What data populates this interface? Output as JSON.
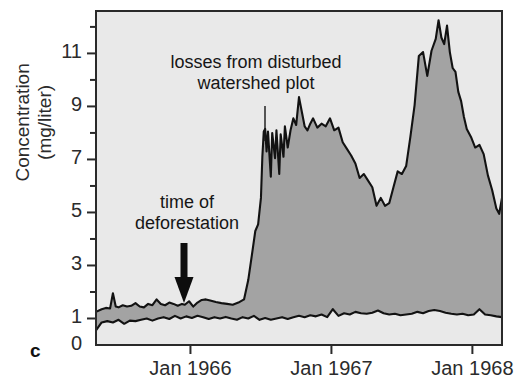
{
  "figure": {
    "panel_letter": "c",
    "ylabel": "Concentration\n(mg/liter)",
    "bg_color": "#e9e9e9",
    "fill_color": "#a3a3a3",
    "line_color": "#121212",
    "frame_color": "#2a2a2a"
  },
  "annotations": {
    "disturbed": {
      "text": "losses from disturbed\nwatershed plot",
      "leader_x": 265,
      "leader_y0": 106,
      "leader_y1": 141
    },
    "deforestation": {
      "text": "time of\ndeforestation",
      "arrow_x": 184,
      "arrow_top": 243,
      "arrow_tip": 303
    }
  },
  "chart_data": {
    "type": "area",
    "title": "",
    "xlabel": "",
    "ylabel": "Concentration (mg/liter)",
    "ylim": [
      0,
      12.6
    ],
    "ytick_values": [
      0,
      1,
      3,
      5,
      7,
      9,
      11
    ],
    "ytick_labels": [
      "0",
      "1",
      "3",
      "5",
      "7",
      "9",
      "11"
    ],
    "yminor_values": [
      2,
      4,
      6,
      8,
      10,
      12
    ],
    "grid": false,
    "legend": "none",
    "xtick_labels": [
      "Jan 1966",
      "Jan 1967",
      "Jan 1968"
    ],
    "xtick_positions": [
      1966.0,
      1967.0,
      1968.0
    ],
    "xlim": [
      1965.33,
      1968.21
    ],
    "event_markers": [
      {
        "label": "time of deforestation",
        "x": 1965.96
      },
      {
        "label": "losses from disturbed watershed plot",
        "x": 1966.53
      }
    ],
    "series": [
      {
        "name": "disturbed watershed plot",
        "x": [
          1965.33,
          1965.37,
          1965.4,
          1965.43,
          1965.45,
          1965.47,
          1965.49,
          1965.52,
          1965.55,
          1965.58,
          1965.61,
          1965.64,
          1965.67,
          1965.7,
          1965.73,
          1965.76,
          1965.79,
          1965.82,
          1965.85,
          1965.88,
          1965.91,
          1965.94,
          1965.96,
          1965.99,
          1966.02,
          1966.05,
          1966.08,
          1966.11,
          1966.14,
          1966.18,
          1966.22,
          1966.26,
          1966.3,
          1966.34,
          1966.38,
          1966.41,
          1966.44,
          1966.46,
          1966.48,
          1966.5,
          1966.51,
          1966.52,
          1966.53,
          1966.54,
          1966.55,
          1966.57,
          1966.58,
          1966.6,
          1966.61,
          1966.63,
          1966.64,
          1966.66,
          1966.67,
          1966.69,
          1966.71,
          1966.73,
          1966.75,
          1966.77,
          1966.79,
          1966.81,
          1966.83,
          1966.85,
          1966.87,
          1966.9,
          1966.93,
          1966.96,
          1966.99,
          1967.02,
          1967.05,
          1967.08,
          1967.11,
          1967.14,
          1967.17,
          1967.2,
          1967.23,
          1967.26,
          1967.29,
          1967.32,
          1967.35,
          1967.38,
          1967.41,
          1967.44,
          1967.47,
          1967.5,
          1967.53,
          1967.56,
          1967.59,
          1967.62,
          1967.65,
          1967.68,
          1967.71,
          1967.74,
          1967.76,
          1967.78,
          1967.8,
          1967.82,
          1967.84,
          1967.86,
          1967.88,
          1967.9,
          1967.92,
          1967.94,
          1967.96,
          1967.99,
          1968.02,
          1968.05,
          1968.08,
          1968.11,
          1968.14,
          1968.17,
          1968.19,
          1968.21
        ],
        "y": [
          1.25,
          1.35,
          1.4,
          1.38,
          1.95,
          1.45,
          1.42,
          1.5,
          1.45,
          1.48,
          1.58,
          1.45,
          1.42,
          1.55,
          1.5,
          1.72,
          1.55,
          1.5,
          1.6,
          1.55,
          1.48,
          1.55,
          1.52,
          1.65,
          1.45,
          1.6,
          1.7,
          1.72,
          1.68,
          1.62,
          1.58,
          1.55,
          1.52,
          1.6,
          1.72,
          2.45,
          3.55,
          4.3,
          4.55,
          5.55,
          7.1,
          8.05,
          8.15,
          7.3,
          8.05,
          6.35,
          8.0,
          7.05,
          8.1,
          6.45,
          7.95,
          7.1,
          8.25,
          7.45,
          8.1,
          8.55,
          8.3,
          9.35,
          8.8,
          8.25,
          8.1,
          8.35,
          8.55,
          8.2,
          8.35,
          8.25,
          8.55,
          8.1,
          8.2,
          7.65,
          7.4,
          7.15,
          6.85,
          6.3,
          6.45,
          6.2,
          5.95,
          5.25,
          5.55,
          5.25,
          5.35,
          5.95,
          6.55,
          6.45,
          6.75,
          7.85,
          9.05,
          10.9,
          11.05,
          10.15,
          11.1,
          11.55,
          12.25,
          11.6,
          11.35,
          12.05,
          11.05,
          10.45,
          10.3,
          9.55,
          9.2,
          8.6,
          8.15,
          7.85,
          7.45,
          7.55,
          7.2,
          6.4,
          5.85,
          5.15,
          4.95,
          5.55
        ]
      },
      {
        "name": "control (reference) watershed",
        "x": [
          1965.33,
          1965.37,
          1965.41,
          1965.45,
          1965.49,
          1965.53,
          1965.57,
          1965.61,
          1965.65,
          1965.69,
          1965.73,
          1965.77,
          1965.81,
          1965.85,
          1965.89,
          1965.93,
          1965.97,
          1966.01,
          1966.05,
          1966.09,
          1966.13,
          1966.17,
          1966.21,
          1966.25,
          1966.29,
          1966.33,
          1966.37,
          1966.41,
          1966.45,
          1966.49,
          1966.53,
          1966.57,
          1966.61,
          1966.65,
          1966.69,
          1966.73,
          1966.77,
          1966.81,
          1966.85,
          1966.89,
          1966.93,
          1966.97,
          1967.01,
          1967.05,
          1967.09,
          1967.13,
          1967.17,
          1967.21,
          1967.25,
          1967.29,
          1967.33,
          1967.37,
          1967.41,
          1967.45,
          1967.49,
          1967.53,
          1967.57,
          1967.61,
          1967.65,
          1967.69,
          1967.73,
          1967.77,
          1967.81,
          1967.85,
          1967.89,
          1967.93,
          1967.97,
          1968.01,
          1968.05,
          1968.09,
          1968.13,
          1968.17,
          1968.21
        ],
        "y": [
          0.55,
          0.85,
          0.9,
          0.85,
          0.95,
          0.8,
          0.92,
          0.9,
          0.95,
          1.0,
          0.92,
          1.0,
          1.05,
          0.98,
          1.1,
          1.0,
          1.08,
          1.02,
          1.1,
          1.05,
          0.98,
          1.05,
          1.0,
          1.06,
          1.0,
          0.95,
          1.05,
          1.0,
          1.1,
          0.95,
          1.02,
          0.95,
          1.0,
          1.05,
          0.98,
          1.05,
          1.1,
          1.05,
          1.12,
          1.08,
          1.15,
          1.05,
          1.35,
          1.1,
          1.2,
          1.15,
          1.25,
          1.2,
          1.18,
          1.22,
          1.3,
          1.2,
          1.15,
          1.18,
          1.12,
          1.15,
          1.18,
          1.25,
          1.2,
          1.28,
          1.32,
          1.28,
          1.22,
          1.18,
          1.15,
          1.18,
          1.12,
          1.15,
          1.35,
          1.15,
          1.12,
          1.08,
          1.05
        ]
      }
    ]
  }
}
